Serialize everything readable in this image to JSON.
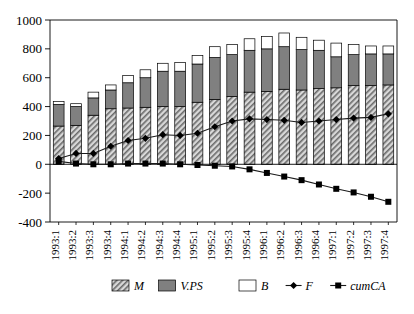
{
  "chart_data": {
    "type": "bar",
    "stacked": true,
    "title": "",
    "subtitle": "",
    "xlabel": "",
    "ylabel": "",
    "ylim": [
      -400,
      1000
    ],
    "yticks": [
      1000,
      800,
      600,
      400,
      200,
      0,
      -200,
      -400
    ],
    "ytick_labels": [
      "1000",
      "800",
      "600",
      "400",
      "200",
      "0",
      "-200",
      "-400"
    ],
    "grid": false,
    "legend_position": "bottom",
    "categories": [
      "1993:1",
      "1993:2",
      "1993:3",
      "1993:4",
      "1994:1",
      "1994:2",
      "1994:3",
      "1994:4",
      "1995:1",
      "1995:2",
      "1995:3",
      "1995:4",
      "1996:1",
      "1996:2",
      "1996:3",
      "1996:4",
      "1997:1",
      "1997:2",
      "1997:3",
      "1997:4"
    ],
    "series": [
      {
        "name": "M",
        "label": "M",
        "kind": "bar-segment",
        "fill": "hatch",
        "color": "#b5b5b5",
        "values": [
          265,
          270,
          340,
          385,
          390,
          395,
          400,
          400,
          430,
          450,
          470,
          500,
          505,
          520,
          515,
          525,
          530,
          545,
          545,
          550
        ]
      },
      {
        "name": "V.PS",
        "label": "V.PS",
        "kind": "bar-segment",
        "fill": "solid",
        "color": "#808080",
        "values": [
          150,
          130,
          120,
          130,
          175,
          205,
          245,
          245,
          265,
          290,
          290,
          290,
          295,
          295,
          280,
          265,
          215,
          215,
          220,
          215
        ]
      },
      {
        "name": "B",
        "label": "B",
        "kind": "bar-segment",
        "fill": "white",
        "color": "#ffffff",
        "values": [
          20,
          20,
          40,
          35,
          50,
          55,
          55,
          60,
          60,
          75,
          70,
          80,
          85,
          95,
          85,
          70,
          95,
          70,
          55,
          55
        ]
      },
      {
        "name": "F",
        "label": "F",
        "kind": "line",
        "marker": "diamond",
        "color": "#000000",
        "values": [
          40,
          75,
          75,
          125,
          165,
          180,
          205,
          200,
          215,
          260,
          300,
          315,
          310,
          305,
          290,
          300,
          310,
          320,
          325,
          350
        ]
      },
      {
        "name": "cumCA",
        "label": "cumCA",
        "kind": "line",
        "marker": "square",
        "color": "#000000",
        "values": [
          20,
          5,
          0,
          0,
          5,
          5,
          5,
          0,
          -5,
          -10,
          -15,
          -35,
          -60,
          -85,
          -110,
          -140,
          -170,
          -195,
          -225,
          -260
        ]
      }
    ]
  },
  "legend": {
    "items": [
      {
        "label": "M",
        "swatch": "hatch"
      },
      {
        "label": "V.PS",
        "swatch": "gray"
      },
      {
        "label": "B",
        "swatch": "white"
      },
      {
        "label": "F",
        "swatch": "diamond-line"
      },
      {
        "label": "cumCA",
        "swatch": "square-line"
      }
    ]
  }
}
